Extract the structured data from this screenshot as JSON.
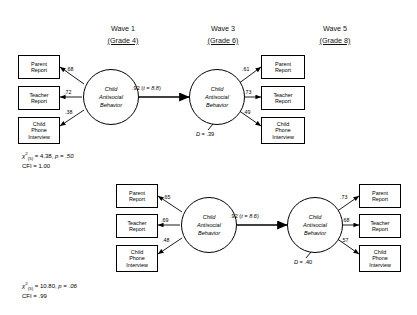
{
  "figure": {
    "headers": [
      {
        "wave": "Wave 1",
        "grade": "(Grade 4)"
      },
      {
        "wave": "Wave 3",
        "grade": "(Grade 6)"
      },
      {
        "wave": "Wave 5",
        "grade": "(Grade 8)"
      }
    ],
    "indicator_labels": {
      "parent": {
        "line1": "Parent",
        "line2": "Report"
      },
      "teacher": {
        "line1": "Teacher",
        "line2": "Report"
      },
      "phone": {
        "line1": "Child",
        "line2": "Phone",
        "line3": "Interview"
      }
    },
    "latent_label": {
      "line1": "Child",
      "line2": "Antisocial",
      "line3": "Behavior"
    },
    "models": [
      {
        "name": "wave1-to-wave3",
        "left_loadings": [
          ".68",
          ".72",
          ".38"
        ],
        "right_loadings": [
          ".61",
          ".73",
          ".49"
        ],
        "structural_path": ".92 (t = 8.8)",
        "structural_coefficient": ".92",
        "structural_t": "t = 8.8",
        "disturbance": "D = .39",
        "disturbance_symbol": "D",
        "disturbance_value": ".39",
        "chi_square": "4.38",
        "chi_df": "(5)",
        "p_value": "p = .50",
        "cfi": "CFI = 1.00"
      },
      {
        "name": "wave3-to-wave5",
        "left_loadings": [
          ".65",
          ".69",
          ".48"
        ],
        "right_loadings": [
          ".73",
          ".68",
          ".57"
        ],
        "structural_path": ".92 (t = 8.6)",
        "structural_coefficient": ".92",
        "structural_t": "t = 8.6",
        "disturbance": "D = .40",
        "disturbance_symbol": "D",
        "disturbance_value": ".40",
        "chi_square": "10.80",
        "chi_df": "(5)",
        "p_value": "p = .06",
        "cfi": "CFI = .99"
      }
    ],
    "colors": {
      "stroke": "#000000",
      "background": "#ffffff"
    }
  }
}
